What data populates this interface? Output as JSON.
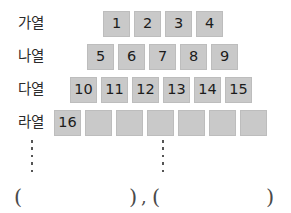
{
  "worksheet": {
    "rows": [
      {
        "label": "가열",
        "cells": [
          "1",
          "2",
          "3",
          "4"
        ],
        "empty_cells": 0,
        "left": 103,
        "top": 10
      },
      {
        "label": "나열",
        "cells": [
          "5",
          "6",
          "7",
          "8",
          "9"
        ],
        "empty_cells": 0,
        "left": 87,
        "top": 43
      },
      {
        "label": "다열",
        "cells": [
          "10",
          "11",
          "12",
          "13",
          "14",
          "15"
        ],
        "empty_cells": 0,
        "left": 70,
        "top": 76
      },
      {
        "label": "라열",
        "cells": [
          "16"
        ],
        "empty_cells": 6,
        "left": 54,
        "top": 109
      }
    ],
    "continuation_dots": [
      {
        "left": 30,
        "top": 140,
        "height": 32,
        "count": 5
      },
      {
        "left": 161,
        "top": 140,
        "height": 32,
        "count": 5
      }
    ],
    "answer_blanks": {
      "open_paren_1": "(",
      "close_paren_1": ")",
      "separator": ",",
      "open_paren_2": "(",
      "close_paren_2": ")",
      "positions": {
        "open_1_left": 14,
        "close_1_left": 129,
        "comma_left": 141,
        "open_2_left": 152,
        "close_2_left": 266
      }
    },
    "colors": {
      "cell_fill": "#c9c9c9",
      "cell_border": "#bdbdbd",
      "text": "#1c1c1c",
      "label_text": "#2b2b2b",
      "dot": "#555555",
      "paren": "#4a4a4a",
      "background": "#ffffff"
    }
  }
}
